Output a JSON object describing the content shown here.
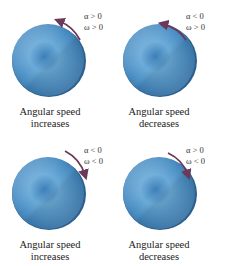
{
  "colors": {
    "disc_light": "#8ec3e6",
    "disc_mid": "#4f94c8",
    "disc_dark": "#2f6fa6",
    "disc_rim": "#3a7ab0",
    "arrow": "#6b3a5a"
  },
  "panels": [
    {
      "position": "top-left",
      "alpha": "α > 0",
      "omega": "ω > 0",
      "rotation": "counterclockwise",
      "caption_line1": "Angular speed",
      "caption_line2": "increases"
    },
    {
      "position": "top-right",
      "alpha": "α < 0",
      "omega": "ω > 0",
      "rotation": "counterclockwise",
      "caption_line1": "Angular speed",
      "caption_line2": "decreases"
    },
    {
      "position": "bottom-left",
      "alpha": "α < 0",
      "omega": "ω < 0",
      "rotation": "clockwise",
      "caption_line1": "Angular speed",
      "caption_line2": "increases"
    },
    {
      "position": "bottom-right",
      "alpha": "α > 0",
      "omega": "ω < 0",
      "rotation": "clockwise",
      "caption_line1": "Angular speed",
      "caption_line2": "decreases"
    }
  ]
}
